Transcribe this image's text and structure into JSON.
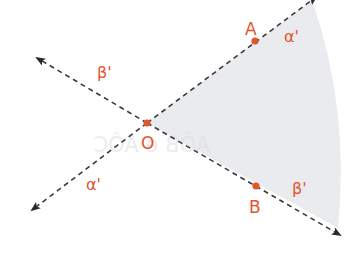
{
  "diagram": {
    "colors": {
      "sector_fill": "#e9ebee",
      "line": "#3a3a3a",
      "point": "#e2552a",
      "label": "#e2552a",
      "ghost_text": "#d9dbde"
    },
    "points": [
      {
        "id": "O",
        "label": "O"
      },
      {
        "id": "A",
        "label": "A"
      },
      {
        "id": "B",
        "label": "B"
      }
    ],
    "angle_labels": [
      {
        "id": "alpha-prime-upper",
        "text": "α'"
      },
      {
        "id": "beta-prime-upper",
        "text": "β'"
      },
      {
        "id": "alpha-prime-lower",
        "text": "α'"
      },
      {
        "id": "beta-prime-lower",
        "text": "β'"
      }
    ],
    "rays": [
      {
        "id": "ray-OA",
        "style": "dashed",
        "arrow": true
      },
      {
        "id": "ray-OB",
        "style": "dashed",
        "arrow": true
      },
      {
        "id": "ray-opposite-OA",
        "style": "dashed",
        "arrow": true
      },
      {
        "id": "ray-opposite-OB",
        "style": "dashed",
        "arrow": true
      }
    ],
    "shaded_region": "angle AOB sector",
    "bleed_through_text": "AÔB e AÔC"
  }
}
